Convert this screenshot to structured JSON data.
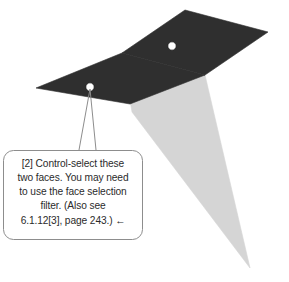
{
  "figure": {
    "canvas": {
      "width": 289,
      "height": 282,
      "background": "#ffffff"
    },
    "colors": {
      "dark_face": "#2f2f2f",
      "light_face": "#d5d5d5",
      "mid_face": "#cfcfcf",
      "marker_fill": "#ffffff",
      "marker_stroke": "#1a1a1a",
      "leader_line": "#8d8d8d",
      "callout_border": "#8d8d8d",
      "callout_fill": "#ffffff",
      "text": "#2b2b2b"
    }
  },
  "model": {
    "dark_face_top": {
      "name": "upper-dark-face",
      "points": "185,10 268,32 205,75 122,53"
    },
    "dark_face_left": {
      "name": "left-dark-face",
      "points": "122,53 205,75 130,104 36,88"
    },
    "light_face_tail": {
      "name": "light-gray-tail-face",
      "points": "122,53 205,75 250,268 132,112"
    },
    "markers": [
      {
        "name": "face-marker-upper",
        "cx": 172,
        "cy": 46,
        "r": 4.2
      },
      {
        "name": "face-marker-lower",
        "cx": 90,
        "cy": 87,
        "r": 4.2
      }
    ]
  },
  "leader": {
    "name": "callout-leader-line",
    "left_path": "M 90,89 L 79,150",
    "right_path": "M 90,89 L 96,150"
  },
  "callout": {
    "box": {
      "x": 3,
      "y": 150,
      "width": 140,
      "height": 90,
      "radius": 10
    },
    "lines": [
      {
        "text": "[2] Control-select these",
        "align": "center"
      },
      {
        "text": "two faces. You may need",
        "align": "center"
      },
      {
        "text": "to use the face selection",
        "align": "center"
      },
      {
        "text": "filter.  (Also see",
        "align": "center"
      },
      {
        "text": "6.1.12[3], page 243.)   ←",
        "align": "center"
      }
    ],
    "full_text": "[2] Control-select these two faces. You may need to use the face selection filter. (Also see 6.1.12[3], page 243.) ←",
    "reference": "6.1.12[3], page 243.",
    "arrow_glyph": "←",
    "step_label": "[2]"
  }
}
